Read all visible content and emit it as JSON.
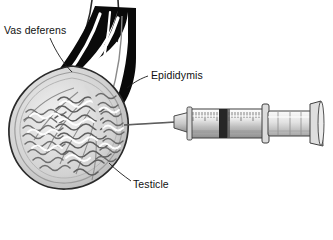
{
  "figure": {
    "background": "#ffffff",
    "labels": {
      "vas_deferens": "Vas deferens",
      "epididymis": "Epididymis",
      "testicle": "Testicle"
    },
    "caption_partial": "",
    "colors": {
      "ink": "#111111",
      "outline": "#2a2a2a",
      "epididymis_dark": "#0a0a0a",
      "tubule_gray": "#8a8a8a",
      "tubule_light": "#d9d9d9",
      "capsule_gray": "#b5b5b5",
      "syringe_body": "#e8e8e8",
      "syringe_shade": "#9a9a9a",
      "plunger_dark": "#2b2b2b",
      "needle": "#4a4a4a",
      "caption_gray": "#6d6d6d"
    }
  },
  "parts": {
    "vas_deferens": "vas-deferens-duct",
    "epididymis": "epididymis-body",
    "testicle": "testicle-cross-section",
    "tubules": "seminiferous-tubules",
    "needle": "syringe-needle",
    "barrel": "syringe-barrel",
    "plunger": "syringe-plunger"
  }
}
